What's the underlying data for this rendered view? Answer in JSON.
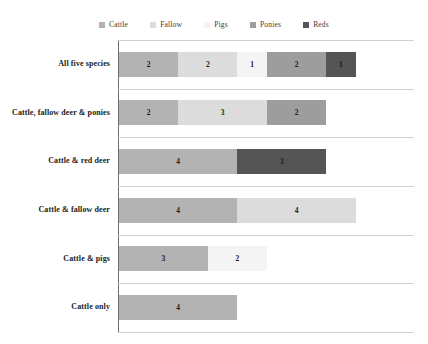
{
  "chart_data": {
    "type": "bar",
    "subtype": "stacked-horizontal",
    "title": "",
    "xlabel": "",
    "ylabel": "",
    "grid": true,
    "legend_position": "top-center",
    "xlim": [
      0,
      10
    ],
    "categories": [
      "All five species",
      "Cattle, fallow deer & ponies",
      "Cattle & red deer",
      "Cattle & fallow deer",
      "Cattle & pigs",
      "Cattle only"
    ],
    "series": [
      {
        "name": "Cattle",
        "color": "#b3b3b3",
        "values": [
          2,
          2,
          4,
          4,
          3,
          4
        ]
      },
      {
        "name": "Fallow",
        "color": "#dcdcdc",
        "values": [
          2,
          3,
          0,
          4,
          0,
          0
        ]
      },
      {
        "name": "Pigs",
        "color": "#f4f4f4",
        "values": [
          1,
          0,
          0,
          0,
          2,
          0
        ]
      },
      {
        "name": "Ponies",
        "color": "#9d9d9d",
        "values": [
          2,
          2,
          0,
          0,
          0,
          0
        ]
      },
      {
        "name": "Reds",
        "color": "#555555",
        "values": [
          1,
          0,
          3,
          0,
          0,
          0
        ]
      }
    ],
    "rows": [
      {
        "category": "All five species",
        "segments": [
          {
            "series": "Cattle",
            "value": 2,
            "label": "2",
            "color": "#b3b3b3"
          },
          {
            "series": "Fallow",
            "value": 2,
            "label": "2",
            "color": "#dcdcdc"
          },
          {
            "series": "Pigs",
            "value": 1,
            "label": "1",
            "color": "#f4f4f4"
          },
          {
            "series": "Ponies",
            "value": 2,
            "label": "2",
            "color": "#9d9d9d"
          },
          {
            "series": "Reds",
            "value": 1,
            "label": "1",
            "color": "#555555"
          }
        ]
      },
      {
        "category": "Cattle, fallow deer & ponies",
        "segments": [
          {
            "series": "Cattle",
            "value": 2,
            "label": "2",
            "color": "#b3b3b3"
          },
          {
            "series": "Fallow",
            "value": 3,
            "label": "3",
            "color": "#dcdcdc"
          },
          {
            "series": "Ponies",
            "value": 2,
            "label": "2",
            "color": "#9d9d9d"
          }
        ]
      },
      {
        "category": "Cattle & red deer",
        "segments": [
          {
            "series": "Cattle",
            "value": 4,
            "label": "4",
            "color": "#b3b3b3"
          },
          {
            "series": "Reds",
            "value": 3,
            "label": "3",
            "color": "#555555"
          }
        ]
      },
      {
        "category": "Cattle & fallow deer",
        "segments": [
          {
            "series": "Cattle",
            "value": 4,
            "label": "4",
            "color": "#b3b3b3"
          },
          {
            "series": "Fallow",
            "value": 4,
            "label": "4",
            "color": "#dcdcdc"
          }
        ]
      },
      {
        "category": "Cattle & pigs",
        "segments": [
          {
            "series": "Cattle",
            "value": 3,
            "label": "3",
            "color": "#b3b3b3"
          },
          {
            "series": "Pigs",
            "value": 2,
            "label": "2",
            "color": "#f4f4f4"
          }
        ]
      },
      {
        "category": "Cattle only",
        "segments": [
          {
            "series": "Cattle",
            "value": 4,
            "label": "4",
            "color": "#b3b3b3"
          }
        ]
      }
    ]
  },
  "legend": {
    "items": [
      {
        "label": "Cattle",
        "color": "#b3b3b3"
      },
      {
        "label": "Fallow",
        "color": "#dcdcdc"
      },
      {
        "label": "Pigs",
        "color": "#f4f4f4"
      },
      {
        "label": "Ponies",
        "color": "#9d9d9d"
      },
      {
        "label": "Reds",
        "color": "#555555"
      }
    ]
  },
  "axis": {
    "line_color": "#6f6f6f",
    "grid_color": "#d2d2d2"
  }
}
